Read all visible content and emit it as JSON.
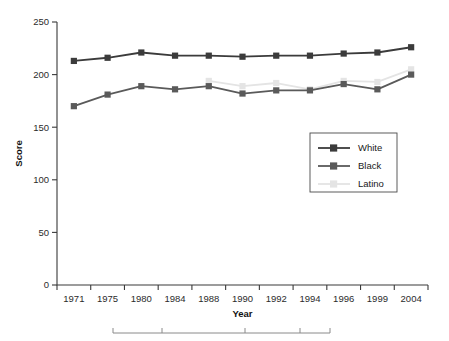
{
  "chart_data": {
    "type": "line",
    "title": "",
    "xlabel": "Year",
    "ylabel": "Score",
    "categories": [
      "1971",
      "1975",
      "1980",
      "1984",
      "1988",
      "1990",
      "1992",
      "1994",
      "1996",
      "1999",
      "2004"
    ],
    "ylim": [
      0,
      250
    ],
    "yticks": [
      0,
      50,
      100,
      150,
      200,
      250
    ],
    "ytick_labels": [
      "0",
      "50",
      "100",
      "150",
      "200",
      "250"
    ],
    "grid": false,
    "legend_position": "center-right",
    "series": [
      {
        "name": "White",
        "color": "#3b3b3b",
        "marker": "square",
        "values": [
          213,
          216,
          221,
          218,
          218,
          217,
          218,
          218,
          220,
          221,
          226
        ]
      },
      {
        "name": "Black",
        "color": "#5a5a5a",
        "marker": "square",
        "values": [
          170,
          181,
          189,
          186,
          189,
          182,
          185,
          185,
          191,
          186,
          200
        ]
      },
      {
        "name": "Latino",
        "color": "#e4e4e4",
        "marker": "square",
        "values": [
          null,
          null,
          null,
          null,
          194,
          189,
          192,
          186,
          194,
          193,
          205
        ]
      }
    ]
  },
  "axes": {
    "y_title": "Score",
    "x_title": "Year"
  },
  "legend": {
    "entries": [
      {
        "label": "White"
      },
      {
        "label": "Black"
      },
      {
        "label": "Latino"
      }
    ]
  },
  "footer": {
    "rule_present": "true"
  }
}
